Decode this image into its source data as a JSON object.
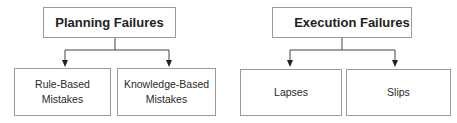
{
  "diagram": {
    "groups": [
      {
        "id": "planning",
        "title": "Planning Failures",
        "children": [
          {
            "label_line1": "Rule-Based",
            "label_line2": "Mistakes"
          },
          {
            "label_line1": "Knowledge-Based",
            "label_line2": "Mistakes"
          }
        ]
      },
      {
        "id": "execution",
        "title": "Execution Failures",
        "children": [
          {
            "label_line1": "Lapses",
            "label_line2": ""
          },
          {
            "label_line1": "Slips",
            "label_line2": ""
          }
        ]
      }
    ],
    "colors": {
      "border": "#9a9a9a",
      "connector": "#333333",
      "text": "#2a2a2a"
    }
  }
}
